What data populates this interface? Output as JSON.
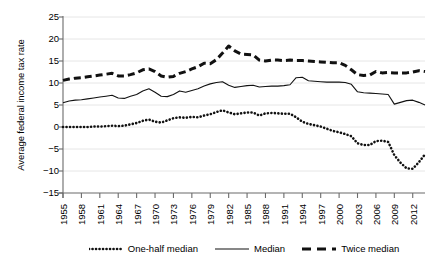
{
  "chart_data": {
    "type": "line",
    "title": "",
    "xlabel": "",
    "ylabel": "Average federal income tax rate",
    "xlim": [
      1955,
      2014
    ],
    "ylim": [
      -15,
      25
    ],
    "ytick_labels": [
      "25",
      "20",
      "15",
      "10",
      "5",
      "0",
      "−5",
      "−10",
      "−15"
    ],
    "ytick_values": [
      25,
      20,
      15,
      10,
      5,
      0,
      -5,
      -10,
      -15
    ],
    "xtick_labels": [
      "1955",
      "1958",
      "1961",
      "1964",
      "1967",
      "1970",
      "1973",
      "1976",
      "1979",
      "1982",
      "1985",
      "1988",
      "1991",
      "1994",
      "1997",
      "2000",
      "2003",
      "2006",
      "2009",
      "2012"
    ],
    "xtick_values": [
      1955,
      1958,
      1961,
      1964,
      1967,
      1970,
      1973,
      1976,
      1979,
      1982,
      1985,
      1988,
      1991,
      1994,
      1997,
      2000,
      2003,
      2006,
      2009,
      2012
    ],
    "grid": "horizontal",
    "legend_position": "below",
    "x": [
      1955,
      1956,
      1957,
      1958,
      1959,
      1960,
      1961,
      1962,
      1963,
      1964,
      1965,
      1966,
      1967,
      1968,
      1969,
      1970,
      1971,
      1972,
      1973,
      1974,
      1975,
      1976,
      1977,
      1978,
      1979,
      1980,
      1981,
      1982,
      1983,
      1984,
      1985,
      1986,
      1987,
      1988,
      1989,
      1990,
      1991,
      1992,
      1993,
      1994,
      1995,
      1996,
      1997,
      1998,
      1999,
      2000,
      2001,
      2002,
      2003,
      2004,
      2005,
      2006,
      2007,
      2008,
      2009,
      2010,
      2011,
      2012,
      2013,
      2014
    ],
    "series": [
      {
        "name": "One-half median",
        "style": "dotted",
        "color": "#111111",
        "values": [
          0.0,
          0.0,
          0.0,
          0.0,
          0.0,
          0.1,
          0.1,
          0.2,
          0.3,
          0.2,
          0.3,
          0.6,
          0.9,
          1.4,
          1.7,
          1.2,
          1.0,
          1.5,
          2.0,
          2.2,
          2.1,
          2.3,
          2.2,
          2.6,
          2.9,
          3.4,
          3.8,
          3.3,
          2.9,
          3.1,
          3.3,
          3.3,
          2.6,
          3.1,
          3.2,
          3.1,
          3.0,
          3.0,
          2.2,
          1.2,
          0.7,
          0.4,
          0.1,
          -0.4,
          -0.9,
          -1.2,
          -1.6,
          -2.1,
          -3.7,
          -4.1,
          -4.1,
          -3.2,
          -3.1,
          -3.4,
          -6.4,
          -8.1,
          -9.4,
          -9.5,
          -8.0,
          -6.2
        ]
      },
      {
        "name": "Median",
        "style": "solid",
        "color": "#111111",
        "values": [
          5.5,
          5.9,
          6.1,
          6.2,
          6.4,
          6.6,
          6.8,
          7.0,
          7.2,
          6.6,
          6.5,
          7.0,
          7.4,
          8.2,
          8.7,
          7.9,
          7.0,
          6.9,
          7.4,
          8.2,
          7.9,
          8.3,
          8.7,
          9.3,
          9.8,
          10.1,
          10.3,
          9.5,
          9.0,
          9.2,
          9.4,
          9.5,
          9.1,
          9.2,
          9.3,
          9.3,
          9.4,
          9.6,
          11.2,
          11.3,
          10.5,
          10.4,
          10.3,
          10.2,
          10.2,
          10.2,
          10.1,
          9.7,
          8.0,
          7.8,
          7.7,
          7.6,
          7.5,
          7.4,
          5.2,
          5.6,
          6.0,
          6.1,
          5.6,
          5.0
        ]
      },
      {
        "name": "Twice median",
        "style": "dashed",
        "color": "#111111",
        "values": [
          10.6,
          10.9,
          11.1,
          11.2,
          11.4,
          11.6,
          11.8,
          12.0,
          12.2,
          11.6,
          11.6,
          11.9,
          12.3,
          13.0,
          13.2,
          12.6,
          11.6,
          11.3,
          11.5,
          12.2,
          12.6,
          13.2,
          13.7,
          14.5,
          14.4,
          15.3,
          16.8,
          18.4,
          17.3,
          16.6,
          16.5,
          16.4,
          15.2,
          15.0,
          15.2,
          15.2,
          15.1,
          15.2,
          15.1,
          15.1,
          15.0,
          14.9,
          14.8,
          14.7,
          14.6,
          14.6,
          14.0,
          13.0,
          11.9,
          11.7,
          11.8,
          12.6,
          12.3,
          12.4,
          12.3,
          12.3,
          12.3,
          12.5,
          12.8,
          12.6
        ]
      }
    ]
  },
  "legend": {
    "items": [
      {
        "label": "One-half median",
        "style": "dotted"
      },
      {
        "label": "Median",
        "style": "solid"
      },
      {
        "label": "Twice median",
        "style": "dashed"
      }
    ]
  },
  "axes": {
    "ylabel": "Average federal income tax rate"
  }
}
